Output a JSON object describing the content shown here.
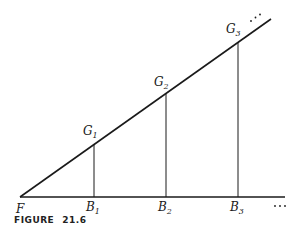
{
  "figure": {
    "caption_label": "FIGURE",
    "caption_number": "21.6",
    "origin_label": "F",
    "ellipsis": "⋯",
    "ground_points": [
      {
        "letter": "B",
        "sub": "1"
      },
      {
        "letter": "B",
        "sub": "2"
      },
      {
        "letter": "B",
        "sub": "3"
      }
    ],
    "top_points": [
      {
        "letter": "G",
        "sub": "1"
      },
      {
        "letter": "G",
        "sub": "2"
      },
      {
        "letter": "G",
        "sub": "3"
      }
    ],
    "line_color": "#1a1a1a"
  }
}
